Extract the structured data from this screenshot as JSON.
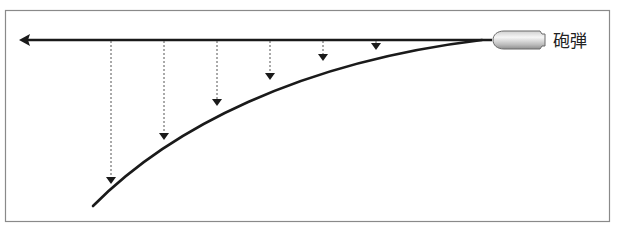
{
  "diagram": {
    "title": "",
    "bullet_label": "砲弾",
    "colors": {
      "frame": "#8a8a8a",
      "line": "#1a1a1a",
      "dashed": "#555555",
      "bullet_fill_light": "#f4f4f4",
      "bullet_fill_dark": "#a8a8a8"
    },
    "drops": [
      {
        "x": 376,
        "y_end": 45
      },
      {
        "x": 323,
        "y_end": 58
      },
      {
        "x": 270,
        "y_end": 77
      },
      {
        "x": 217,
        "y_end": 103
      },
      {
        "x": 164,
        "y_end": 137
      },
      {
        "x": 111,
        "y_end": 181
      }
    ]
  }
}
